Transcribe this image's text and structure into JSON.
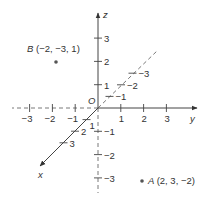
{
  "diagram": {
    "origin_label": "O",
    "axes": {
      "x": {
        "label": "x",
        "positive_ticks": [
          "1",
          "2",
          "3"
        ],
        "negative_ticks": [
          "−1",
          "−2",
          "−3"
        ]
      },
      "y": {
        "label": "y",
        "positive_ticks": [
          "1",
          "2",
          "3"
        ],
        "negative_ticks": [
          "−1",
          "−2",
          "−3"
        ]
      },
      "z": {
        "label": "z",
        "positive_ticks": [
          "1",
          "2",
          "3"
        ],
        "negative_ticks": [
          "−1",
          "−2",
          "−3"
        ]
      }
    },
    "points": [
      {
        "name": "A",
        "coords": [
          2,
          3,
          -2
        ],
        "label": "A (2, 3, −2)",
        "label_letter": "A",
        "label_coords": "(2, 3, −2)"
      },
      {
        "name": "B",
        "coords": [
          -2,
          -3,
          1
        ],
        "label": "B (−2, −3, 1)",
        "label_letter": "B",
        "label_coords": "(−2, −3, 1)"
      }
    ]
  }
}
